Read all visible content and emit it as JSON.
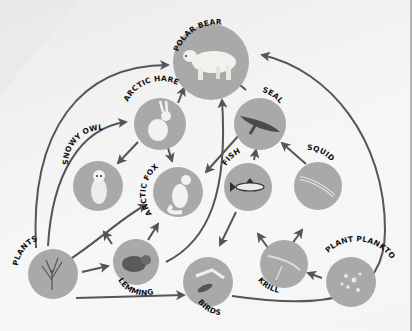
{
  "diagram": {
    "colors": {
      "node_fill": "#a8a8a8",
      "arrow": "#555555",
      "label": "#111111",
      "background": "#f4f4f4"
    },
    "nodes": [
      {
        "id": "polar_bear",
        "label": "POLAR BEAR",
        "icon": "polar-bear-icon"
      },
      {
        "id": "arctic_hare",
        "label": "ARCTIC HARE",
        "icon": "arctic-hare-icon"
      },
      {
        "id": "seal",
        "label": "SEAL",
        "icon": "seal-icon"
      },
      {
        "id": "snowy_owl",
        "label": "SNOWY OWL",
        "icon": "snowy-owl-icon"
      },
      {
        "id": "arctic_fox",
        "label": "ARCTIC FOX",
        "icon": "arctic-fox-icon"
      },
      {
        "id": "fish",
        "label": "FISH",
        "icon": "fish-icon"
      },
      {
        "id": "squid",
        "label": "SQUID",
        "icon": "squid-icon"
      },
      {
        "id": "plants",
        "label": "PLANTS",
        "icon": "plants-icon"
      },
      {
        "id": "lemming",
        "label": "LEMMING",
        "icon": "lemming-icon"
      },
      {
        "id": "birds",
        "label": "BIRDS",
        "icon": "birds-icon"
      },
      {
        "id": "krill",
        "label": "KRILL",
        "icon": "krill-icon"
      },
      {
        "id": "plant_plankton",
        "label": "PLANT PLANKTON",
        "icon": "plankton-icon"
      }
    ],
    "edges": [
      [
        "plants",
        "arctic_hare"
      ],
      [
        "plants",
        "polar_bear"
      ],
      [
        "plants",
        "snowy_owl"
      ],
      [
        "plants",
        "arctic_fox"
      ],
      [
        "plants",
        "lemming"
      ],
      [
        "plants",
        "birds"
      ],
      [
        "arctic_hare",
        "polar_bear"
      ],
      [
        "arctic_hare",
        "snowy_owl"
      ],
      [
        "arctic_hare",
        "arctic_fox"
      ],
      [
        "lemming",
        "snowy_owl"
      ],
      [
        "lemming",
        "arctic_fox"
      ],
      [
        "lemming",
        "polar_bear"
      ],
      [
        "seal",
        "polar_bear"
      ],
      [
        "seal",
        "arctic_fox"
      ],
      [
        "fish",
        "seal"
      ],
      [
        "fish",
        "birds"
      ],
      [
        "squid",
        "seal"
      ],
      [
        "krill",
        "fish"
      ],
      [
        "krill",
        "squid"
      ],
      [
        "plant_plankton",
        "krill"
      ],
      [
        "birds",
        "polar_bear"
      ],
      [
        "birds",
        "arctic_fox"
      ]
    ]
  }
}
